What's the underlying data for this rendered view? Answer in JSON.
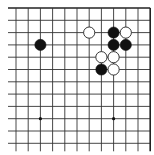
{
  "board": {
    "description": "Go board fragment, top-right corner",
    "columns": 12,
    "rows": 12,
    "origin_x": 16,
    "origin_y": 8,
    "step_x": 12.2,
    "step_y": 12.3,
    "left_overhang": 8,
    "bottom_overhang": 8,
    "edge_top": true,
    "edge_right": true,
    "line_color": "#333333",
    "edge_color": "#222222",
    "background": "#ffffff",
    "stone_radius": 5.6,
    "hoshi": [
      {
        "col": 2,
        "row": 9
      },
      {
        "col": 8,
        "row": 9
      }
    ],
    "stones": [
      {
        "color": "black",
        "col": 2,
        "row": 3
      },
      {
        "color": "white",
        "col": 6,
        "row": 2
      },
      {
        "color": "black",
        "col": 8,
        "row": 2
      },
      {
        "color": "white",
        "col": 9,
        "row": 2
      },
      {
        "color": "black",
        "col": 8,
        "row": 3
      },
      {
        "color": "black",
        "col": 9,
        "row": 3
      },
      {
        "color": "white",
        "col": 7,
        "row": 4
      },
      {
        "color": "white",
        "col": 8,
        "row": 4
      },
      {
        "color": "black",
        "col": 7,
        "row": 5
      },
      {
        "color": "white",
        "col": 8,
        "row": 5
      }
    ]
  }
}
